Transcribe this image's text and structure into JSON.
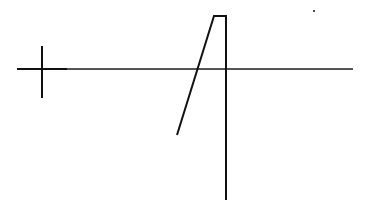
{
  "canvas": {
    "width": 371,
    "height": 208,
    "background": "#ffffff"
  },
  "colors": {
    "ink": "#111111",
    "axis": "#555555"
  },
  "axis_line": {
    "x1": 17,
    "y1": 69,
    "x2": 353,
    "y2": 69
  },
  "crosshair": {
    "cx": 42,
    "cy": 69,
    "v_top": 46,
    "v_bottom": 98,
    "h_left": 17,
    "h_right": 67
  },
  "trace": {
    "points": "177,135 214,16 226,16 226,200"
  },
  "dot": {
    "cx": 314,
    "cy": 11,
    "r": 1
  }
}
